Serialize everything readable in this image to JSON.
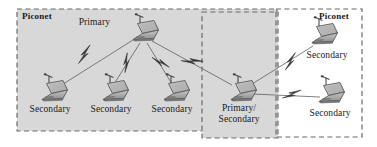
{
  "figure": {
    "background_color": "#ffffff",
    "zone_fill": "#d8d8d8",
    "dash_color": "#666666",
    "line_color": "#555555",
    "text_color": "#1a1a1a"
  },
  "zones": [
    {
      "id": "left-piconet",
      "label": "Piconet",
      "label_position": "top-left",
      "x": 17,
      "y": 9,
      "w": 260,
      "h": 122,
      "filled": true
    },
    {
      "id": "middle-bridge-zone",
      "label": "",
      "label_position": "none",
      "x": 202,
      "y": 12,
      "w": 76,
      "h": 126,
      "filled": true
    },
    {
      "id": "right-piconet",
      "label": "Piconet",
      "label_position": "top-right",
      "x": 276,
      "y": 9,
      "w": 86,
      "h": 128,
      "filled": false
    }
  ],
  "nodes": [
    {
      "id": "n-primary",
      "label": "Primary",
      "role": "primary",
      "icon": "laptop-icon",
      "x": 140,
      "y": 30,
      "label_x": 110,
      "label_y": 22,
      "label_align": "right",
      "scale": 1.0
    },
    {
      "id": "n-sec-1",
      "label": "Secondary",
      "role": "secondary",
      "icon": "laptop-icon",
      "x": 50,
      "y": 92,
      "label_x": 50,
      "label_y": 110,
      "label_align": "center",
      "scale": 1.0
    },
    {
      "id": "n-sec-2",
      "label": "Secondary",
      "role": "secondary",
      "icon": "laptop-icon",
      "x": 111,
      "y": 92,
      "label_x": 111,
      "label_y": 110,
      "label_align": "center",
      "scale": 1.0
    },
    {
      "id": "n-sec-3",
      "label": "Secondary",
      "role": "secondary",
      "icon": "laptop-icon",
      "x": 172,
      "y": 92,
      "label_x": 172,
      "label_y": 110,
      "label_align": "center",
      "scale": 1.0
    },
    {
      "id": "n-bridge",
      "label": "Primary/",
      "label2": "Secondary",
      "role": "primary-secondary",
      "icon": "laptop-icon",
      "x": 239,
      "y": 92,
      "label_x": 239,
      "label_y": 110,
      "label_align": "center",
      "scale": 1.0
    },
    {
      "id": "n-sec-right-top",
      "label": "Secondary",
      "role": "secondary",
      "icon": "laptop-icon",
      "x": 320,
      "y": 34,
      "label_x": 327,
      "label_y": 54,
      "label_align": "center",
      "scale": 1.0
    },
    {
      "id": "n-sec-right-bot",
      "label": "Secondary",
      "role": "secondary",
      "icon": "laptop-icon",
      "x": 327,
      "y": 93,
      "label_x": 330,
      "label_y": 112,
      "label_align": "center",
      "scale": 1.0
    }
  ],
  "links": [
    {
      "id": "link-primary-sec1",
      "from": "n-primary",
      "to": "n-sec-1",
      "x1": 133,
      "y1": 40,
      "x2": 60,
      "y2": 86,
      "bolt_t": 0.5,
      "bolt": true
    },
    {
      "id": "link-primary-sec2",
      "from": "n-primary",
      "to": "n-sec-2",
      "x1": 140,
      "y1": 43,
      "x2": 114,
      "y2": 84,
      "bolt_t": 0.5,
      "bolt": true
    },
    {
      "id": "link-primary-sec3",
      "from": "n-primary",
      "to": "n-sec-3",
      "x1": 147,
      "y1": 43,
      "x2": 172,
      "y2": 84,
      "bolt_t": 0.5,
      "bolt": true
    },
    {
      "id": "link-primary-bridge",
      "from": "n-primary",
      "to": "n-bridge",
      "x1": 152,
      "y1": 41,
      "x2": 232,
      "y2": 85,
      "bolt_t": 0.5,
      "bolt": true
    },
    {
      "id": "link-bridge-rtop",
      "from": "n-bridge",
      "to": "n-sec-right-top",
      "x1": 252,
      "y1": 84,
      "x2": 313,
      "y2": 44,
      "bolt_t": 0.48,
      "bolt": true
    },
    {
      "id": "link-bridge-rbot",
      "from": "n-bridge",
      "to": "n-sec-right-bot",
      "x1": 252,
      "y1": 94,
      "x2": 320,
      "y2": 97,
      "bolt_t": 0.5,
      "bolt": true
    }
  ],
  "icons": {
    "laptop": "laptop-icon",
    "antenna": "antenna-icon",
    "bolt": "lightning-bolt-icon"
  }
}
